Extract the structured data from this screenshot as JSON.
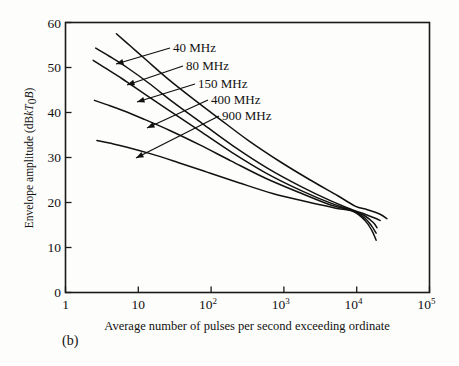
{
  "figure": {
    "panel_caption": "(b)",
    "background_color": "#fdfdfb",
    "line_color": "#111111"
  },
  "chart_data": {
    "type": "line",
    "title": "",
    "xlabel": "Average number of pulses per second exceeding ordinate",
    "ylabel": "Envelope amplitude (dBkT0B)",
    "ylabel_parts": {
      "prefix": "Envelope amplitude (dB",
      "italic_k": "k",
      "italic_T": "T",
      "subscript_zero": "0",
      "italic_B": "B",
      "suffix": ")"
    },
    "xscale": "log",
    "yscale": "linear",
    "xlim": [
      1,
      100000
    ],
    "ylim": [
      0,
      60
    ],
    "xticks": [
      1,
      10,
      100,
      1000,
      10000,
      100000
    ],
    "xtick_labels": [
      "1",
      "10",
      "10",
      "10",
      "10",
      "10"
    ],
    "xtick_exponents": [
      "",
      "",
      "2",
      "3",
      "4",
      "5"
    ],
    "yticks": [
      0,
      10,
      20,
      30,
      40,
      50,
      60
    ],
    "ytick_labels": [
      "0",
      "10",
      "20",
      "30",
      "40",
      "50",
      "60"
    ],
    "grid": false,
    "legend_position": "inline-annotations",
    "series": [
      {
        "name": "40 MHz",
        "label": "40 MHz",
        "x": [
          5.0,
          8,
          13,
          25,
          55,
          130,
          330,
          900,
          2300,
          5500,
          9500,
          14000,
          21000,
          26000
        ],
        "y": [
          57.5,
          54.6,
          51.6,
          47.6,
          43.2,
          38.6,
          33.7,
          29.0,
          25.0,
          21.5,
          19.2,
          18.4,
          17.4,
          16.4
        ]
      },
      {
        "name": "80 MHz",
        "label": "80 MHz",
        "x": [
          2.6,
          4,
          7,
          14,
          30,
          75,
          200,
          600,
          1700,
          4500,
          9000,
          13000,
          18000,
          21000
        ],
        "y": [
          54.3,
          52.5,
          50.0,
          46.5,
          42.3,
          37.6,
          32.6,
          27.6,
          23.6,
          20.3,
          18.3,
          17.4,
          16.5,
          16.0
        ]
      },
      {
        "name": "150 MHz",
        "label": "150 MHz",
        "x": [
          2.4,
          3.5,
          6,
          12,
          28,
          70,
          190,
          560,
          1700,
          4500,
          9000,
          13000,
          17000,
          19000
        ],
        "y": [
          51.6,
          49.9,
          47.5,
          44.2,
          40.2,
          35.9,
          31.2,
          26.6,
          22.7,
          19.8,
          18.2,
          17.0,
          15.5,
          14.4
        ]
      },
      {
        "name": "400 MHz",
        "label": "400 MHz",
        "x": [
          2.5,
          3.6,
          6,
          12,
          28,
          70,
          190,
          560,
          1700,
          4500,
          9000,
          13000,
          16000,
          18500
        ],
        "y": [
          42.7,
          41.8,
          40.5,
          38.5,
          35.9,
          32.8,
          29.2,
          25.4,
          22.1,
          19.4,
          18.1,
          16.5,
          14.8,
          13.2
        ]
      },
      {
        "name": "900 MHz",
        "label": "900 MHz",
        "x": [
          2.7,
          4,
          7,
          15,
          35,
          90,
          240,
          700,
          2000,
          5000,
          9000,
          13000,
          16000,
          18500
        ],
        "y": [
          33.8,
          33.2,
          32.3,
          30.8,
          28.9,
          26.7,
          24.4,
          22.0,
          20.2,
          18.8,
          18.0,
          16.0,
          13.9,
          11.6
        ]
      }
    ],
    "annotations": [
      {
        "label": "40 MHz",
        "text_x": 173,
        "text_y": 52,
        "arrow_to_x": 116,
        "arrow_to_y": 64
      },
      {
        "label": "80 MHz",
        "text_x": 186,
        "text_y": 70,
        "arrow_to_x": 127,
        "arrow_to_y": 85
      },
      {
        "label": "150 MHz",
        "text_x": 198,
        "text_y": 88,
        "arrow_to_x": 137,
        "arrow_to_y": 102
      },
      {
        "label": "400 MHz",
        "text_x": 211,
        "text_y": 104,
        "arrow_to_x": 147,
        "arrow_to_y": 128
      },
      {
        "label": "900 MHz",
        "text_x": 222,
        "text_y": 120,
        "arrow_to_x": 136,
        "arrow_to_y": 158
      }
    ]
  }
}
